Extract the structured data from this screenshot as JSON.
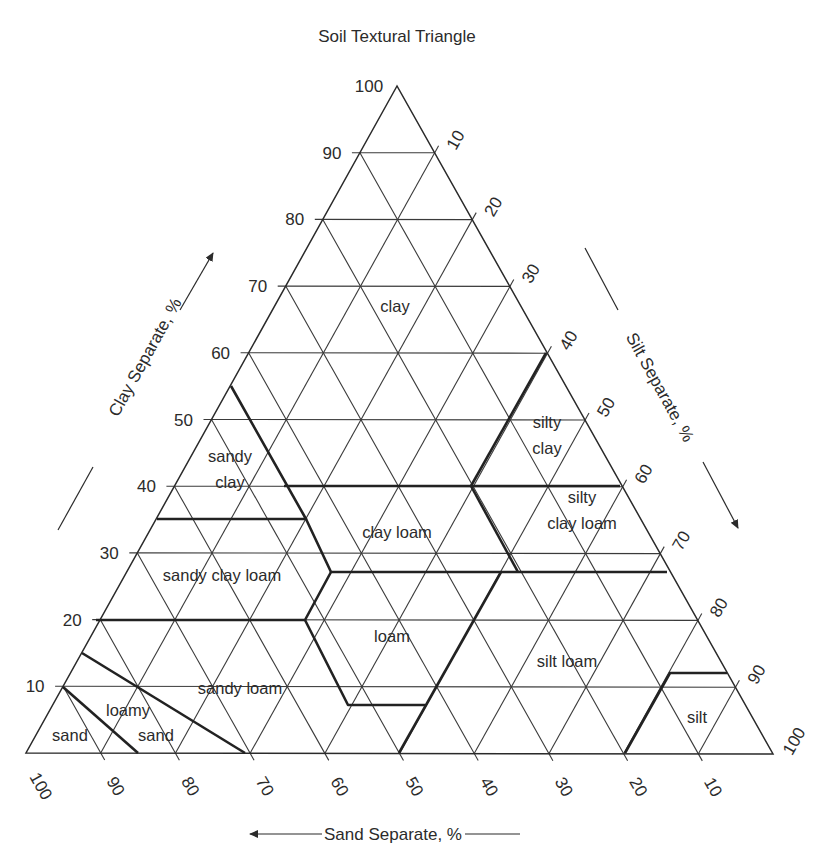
{
  "title": "Soil Textural Triangle",
  "axes": {
    "clay": {
      "label": "Clay Separate, %",
      "ticks": [
        "10",
        "20",
        "30",
        "40",
        "50",
        "60",
        "70",
        "80",
        "90",
        "100"
      ]
    },
    "silt": {
      "label": "Silt Separate, %",
      "ticks": [
        "10",
        "20",
        "30",
        "40",
        "50",
        "60",
        "70",
        "80",
        "90",
        "100"
      ]
    },
    "sand": {
      "label": "Sand Separate, %",
      "ticks": [
        "100",
        "90",
        "80",
        "70",
        "60",
        "50",
        "40",
        "30",
        "20",
        "10"
      ]
    }
  },
  "regions": [
    {
      "id": "clay",
      "lines": [
        "clay"
      ]
    },
    {
      "id": "silty-clay",
      "lines": [
        "silty",
        "clay"
      ]
    },
    {
      "id": "sandy-clay",
      "lines": [
        "sandy",
        "clay"
      ]
    },
    {
      "id": "silty-clay-loam",
      "lines": [
        "silty",
        "clay loam"
      ]
    },
    {
      "id": "clay-loam",
      "lines": [
        "clay loam"
      ]
    },
    {
      "id": "sandy-clay-loam",
      "lines": [
        "sandy clay loam"
      ]
    },
    {
      "id": "loam",
      "lines": [
        "loam"
      ]
    },
    {
      "id": "silt-loam",
      "lines": [
        "silt loam"
      ]
    },
    {
      "id": "sandy-loam",
      "lines": [
        "sandy loam"
      ]
    },
    {
      "id": "loamy-sand",
      "lines": [
        "loamy",
        "sand"
      ]
    },
    {
      "id": "sand",
      "lines": [
        "sand"
      ]
    },
    {
      "id": "silt",
      "lines": [
        "silt"
      ]
    }
  ],
  "colors": {
    "ink": "#2b2b2b",
    "background": "#ffffff"
  }
}
